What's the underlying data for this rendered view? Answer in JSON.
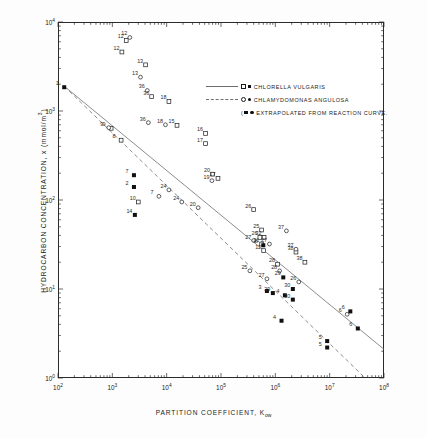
{
  "chart_data": {
    "type": "scatter",
    "title": "",
    "xlabel": "PARTITION COEFFICIENT, Kow",
    "ylabel": "HYDROCARBON CONCENTRATION, x (mmol/m3)",
    "xscale": "log",
    "yscale": "log",
    "xlim": [
      100,
      100000000
    ],
    "ylim": [
      1,
      10000
    ],
    "grid": false,
    "x_tick_labels": [
      "10",
      "10",
      "10",
      "10",
      "10",
      "10",
      "10"
    ],
    "x_tick_exponents": [
      "2",
      "3",
      "4",
      "5",
      "6",
      "7",
      "8"
    ],
    "y_tick_labels": [
      "10",
      "10",
      "10",
      "10"
    ],
    "y_tick_exponents": [
      "4",
      "3",
      "2",
      "1"
    ],
    "legend": {
      "position": "upper-right-inside",
      "entries": [
        {
          "label": "CHLORELLA  VULGARIS",
          "line": "solid",
          "markers": [
            "open-square",
            "filled-square"
          ]
        },
        {
          "label": "CHLAMYDOMONAS  ANGULOSA",
          "line": "dashed",
          "markers": [
            "open-circle",
            "filled-circle"
          ]
        },
        {
          "label": "EXTRAPOLATED  FROM  REACTION CURVE.",
          "line": "none",
          "markers": [
            "filled-square",
            "filled-circle"
          ],
          "prefix": "("
        }
      ]
    },
    "series": [
      {
        "name": "CHLORELLA VULGARIS",
        "marker": "open-square",
        "points": [
          {
            "label": "12",
            "x": 1800,
            "y": 6200
          },
          {
            "label": "13",
            "x": 4100,
            "y": 3300
          },
          {
            "label": "36",
            "x": 5300,
            "y": 1450
          },
          {
            "label": "18",
            "x": 11000,
            "y": 1280
          },
          {
            "label": "15",
            "x": 15500,
            "y": 690
          },
          {
            "label": "16",
            "x": 52000,
            "y": 560
          },
          {
            "label": "17",
            "x": 52000,
            "y": 430
          },
          {
            "label": "10",
            "x": 3000,
            "y": 95
          },
          {
            "label": "17",
            "x": 88000,
            "y": 175
          },
          {
            "label": "20",
            "x": 70000,
            "y": 195
          },
          {
            "label": "26",
            "x": 400000,
            "y": 78
          },
          {
            "label": "25",
            "x": 560000,
            "y": 46
          },
          {
            "label": "32",
            "x": 620000,
            "y": 38
          },
          {
            "label": "26",
            "x": 520000,
            "y": 38
          },
          {
            "label": "21",
            "x": 560000,
            "y": 32
          },
          {
            "label": "11",
            "x": 610000,
            "y": 27
          },
          {
            "label": "38",
            "x": 2400000,
            "y": 26
          },
          {
            "label": "38",
            "x": 3500000,
            "y": 20
          },
          {
            "label": "28",
            "x": 1100000,
            "y": 19
          },
          {
            "label": "9",
            "x": 950,
            "y": 640
          },
          {
            "label": "12",
            "x": 1500,
            "y": 4600
          },
          {
            "label": "8",
            "x": 1450,
            "y": 470
          }
        ]
      },
      {
        "name": "CHLAMYDOMONAS ANGULOSA",
        "marker": "open-circle",
        "points": [
          {
            "label": "12",
            "x": 2100,
            "y": 6700
          },
          {
            "label": "13",
            "x": 3300,
            "y": 2400
          },
          {
            "label": "36",
            "x": 4400,
            "y": 1700
          },
          {
            "label": "36",
            "x": 4600,
            "y": 740
          },
          {
            "label": "18",
            "x": 9500,
            "y": 700
          },
          {
            "label": "9",
            "x": 860,
            "y": 650
          },
          {
            "label": "24",
            "x": 11000,
            "y": 130
          },
          {
            "label": "24",
            "x": 19000,
            "y": 95
          },
          {
            "label": "19",
            "x": 68000,
            "y": 165
          },
          {
            "label": "20",
            "x": 38000,
            "y": 82
          },
          {
            "label": "7",
            "x": 7200,
            "y": 110
          },
          {
            "label": "27",
            "x": 400000,
            "y": 35
          },
          {
            "label": "27",
            "x": 780000,
            "y": 32
          },
          {
            "label": "37",
            "x": 1600000,
            "y": 45
          },
          {
            "label": "37",
            "x": 2400000,
            "y": 28
          },
          {
            "label": "25",
            "x": 340000,
            "y": 16
          },
          {
            "label": "27",
            "x": 700000,
            "y": 13
          },
          {
            "label": "26",
            "x": 2700000,
            "y": 12
          },
          {
            "label": "28",
            "x": 1200000,
            "y": 16
          },
          {
            "label": "6",
            "x": 21000000,
            "y": 5.2
          }
        ]
      },
      {
        "name": "EXTRAPOLATED FROM REACTION CURVE",
        "marker": "filled",
        "points": [
          {
            "label": "1",
            "x": 130,
            "y": 1850
          },
          {
            "label": "7",
            "x": 2500,
            "y": 190
          },
          {
            "label": "2",
            "x": 2500,
            "y": 140
          },
          {
            "label": "14",
            "x": 2600,
            "y": 68
          },
          {
            "label": "3",
            "x": 700000,
            "y": 9.5
          },
          {
            "label": "8",
            "x": 600000,
            "y": 31
          },
          {
            "label": "29",
            "x": 1400000,
            "y": 13.5
          },
          {
            "label": "29",
            "x": 900000,
            "y": 9.0
          },
          {
            "label": "30",
            "x": 2100000,
            "y": 10.0
          },
          {
            "label": "30",
            "x": 2100000,
            "y": 7.6
          },
          {
            "label": "4",
            "x": 1500000,
            "y": 8.5
          },
          {
            "label": "4",
            "x": 1300000,
            "y": 4.4
          },
          {
            "label": "5",
            "x": 9000000,
            "y": 2.6
          },
          {
            "label": "5",
            "x": 9000000,
            "y": 2.2
          },
          {
            "label": "6",
            "x": 24000000,
            "y": 5.6
          },
          {
            "label": "6",
            "x": 33000000,
            "y": 3.6
          }
        ]
      }
    ],
    "fit_lines": [
      {
        "name": "CHLORELLA VULGARIS",
        "style": "solid",
        "x1": 130,
        "y1": 1900,
        "x2": 100000000,
        "y2": 2.1
      },
      {
        "name": "CHLAMYDOMONAS ANGULOSA",
        "style": "dashed",
        "x1": 130,
        "y1": 1900,
        "x2": 45000000,
        "y2": 1.0
      }
    ]
  }
}
